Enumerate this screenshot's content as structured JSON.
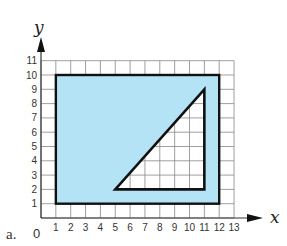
{
  "figure": {
    "part_label": "a.",
    "x_axis_label": "x",
    "y_axis_label": "y",
    "origin_label": "0",
    "x_ticks": [
      "1",
      "2",
      "3",
      "4",
      "5",
      "6",
      "7",
      "8",
      "9",
      "10",
      "11",
      "12",
      "13"
    ],
    "y_ticks": [
      "1",
      "2",
      "3",
      "4",
      "5",
      "6",
      "7",
      "8",
      "9",
      "10",
      "11"
    ],
    "colors": {
      "fill": "#b3e3f4",
      "grid": "#888888",
      "outline": "#111111",
      "background": "#ffffff"
    },
    "rectangle": {
      "x1": 1,
      "y1": 1,
      "x2": 12,
      "y2": 10
    },
    "triangle": {
      "points": [
        [
          5,
          2
        ],
        [
          11,
          2
        ],
        [
          11,
          9
        ]
      ]
    },
    "grid": {
      "x_max": 13,
      "y_max": 11
    }
  }
}
